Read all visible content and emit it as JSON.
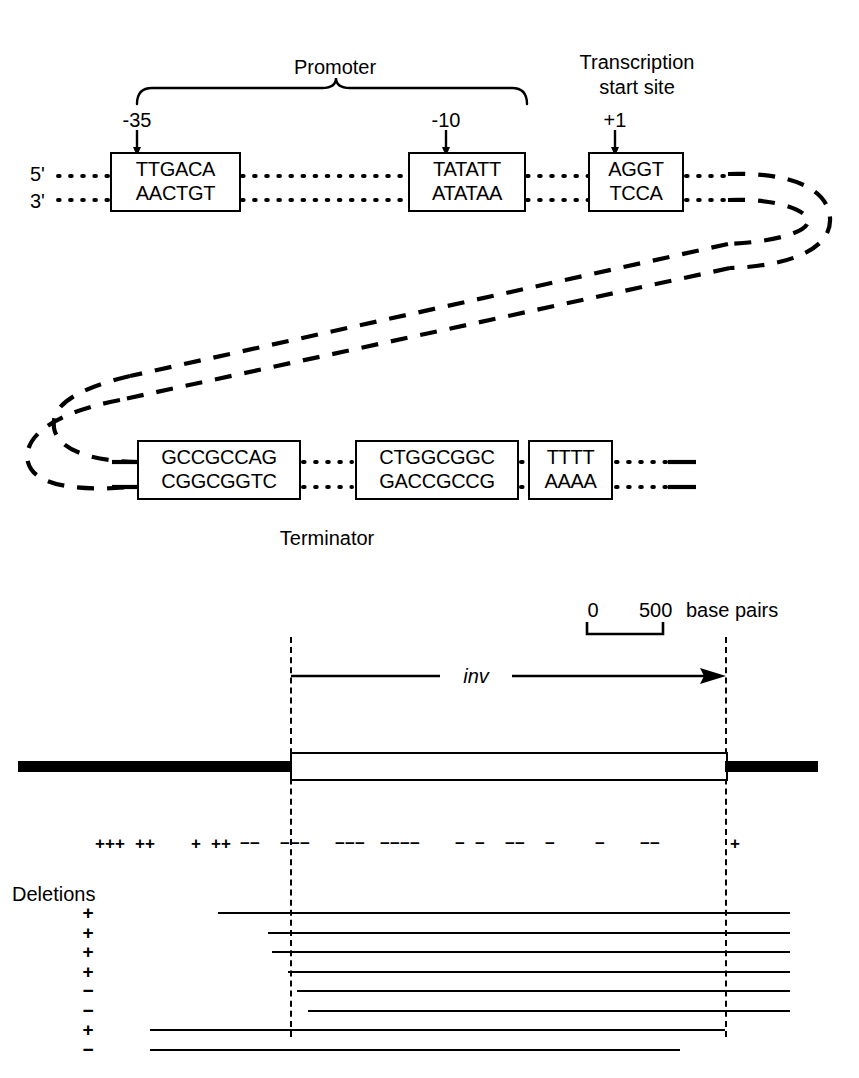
{
  "panel_top": {
    "promoter_label": "Promoter",
    "tss_label_line1": "Transcription",
    "tss_label_line2": "start site",
    "position_minus35": "-35",
    "position_minus10": "-10",
    "position_plus1": "+1",
    "strand_label_five": "5'",
    "strand_label_three": "3'",
    "terminator_label": "Terminator",
    "boxes": [
      {
        "id": "box-minus35",
        "top": "TTGACA",
        "bottom": "AACTGT"
      },
      {
        "id": "box-minus10",
        "top": "TATATT",
        "bottom": "ATATAA"
      },
      {
        "id": "box-start",
        "top": "AGGT",
        "bottom": "TCCA"
      },
      {
        "id": "box-term-left",
        "top": "GCCGCCAG",
        "bottom": "CGGCGGTC"
      },
      {
        "id": "box-term-right",
        "top": "CTGGCGGC",
        "bottom": "GACCGCCG"
      },
      {
        "id": "box-polyT",
        "top": "TTTT",
        "bottom": "AAAA"
      }
    ]
  },
  "panel_bottom": {
    "scale": {
      "start_label": "0",
      "end_label": "500",
      "unit_label": "base pairs"
    },
    "gene_label": "inv",
    "deletions_label": "Deletions",
    "marker_row": {
      "plus_positions": [
        100,
        110,
        120,
        140,
        150,
        196,
        216,
        226
      ],
      "minus_positions": [
        245,
        255,
        285,
        295,
        305,
        340,
        350,
        360,
        385,
        395,
        405,
        415,
        460,
        480,
        510,
        520,
        550,
        600,
        645,
        655
      ],
      "final_plus_position": 735,
      "plus_symbol": "+",
      "minus_symbol": "−"
    },
    "deletion_rows": [
      {
        "sign": "+",
        "start": 218,
        "end": 790
      },
      {
        "sign": "+",
        "start": 268,
        "end": 790
      },
      {
        "sign": "+",
        "start": 272,
        "end": 790
      },
      {
        "sign": "+",
        "start": 288,
        "end": 790
      },
      {
        "sign": "−",
        "start": 297,
        "end": 790
      },
      {
        "sign": "−",
        "start": 308,
        "end": 790
      },
      {
        "sign": "+",
        "start": 150,
        "end": 725
      },
      {
        "sign": "−",
        "start": 150,
        "end": 680
      }
    ]
  }
}
